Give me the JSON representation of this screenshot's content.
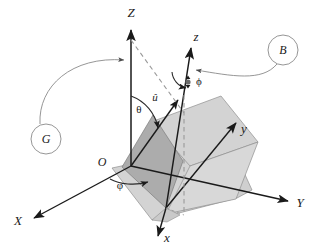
{
  "figure": {
    "background_color": "#ffffff",
    "width": 317,
    "height": 250
  },
  "colors": {
    "stroke": "#1a1a1a",
    "thin_stroke": "#5a5a5a",
    "plane_dark": "#acacac",
    "plane_mid": "#c6c6c6",
    "plane_light": "#d3d3d3",
    "dashed": "#9a9a9a",
    "label_text": "#1a1a1a"
  },
  "axes": {
    "fixed_frame": [
      {
        "name": "Z-axis",
        "label": "Z",
        "label_x": 131,
        "label_y": 14
      },
      {
        "name": "X-axis",
        "label": "X",
        "label_x": 18,
        "label_y": 222
      },
      {
        "name": "Y-axis",
        "label": "Y",
        "label_x": 300,
        "label_y": 204
      }
    ],
    "body_frame": [
      {
        "name": "z-axis",
        "label": "z",
        "label_x": 196,
        "label_y": 38
      },
      {
        "name": "x-axis",
        "label": "x",
        "label_x": 167,
        "label_y": 239
      },
      {
        "name": "y-axis",
        "label": "y",
        "label_x": 244,
        "label_y": 130
      }
    ]
  },
  "origin": {
    "label": "O",
    "label_x": 102,
    "label_y": 163
  },
  "vectors": [
    {
      "name": "u-hat-unit-vector",
      "label": "û",
      "label_x": 155,
      "label_y": 98
    }
  ],
  "angles": [
    {
      "name": "theta-angle",
      "label": "θ",
      "label_x": 139,
      "label_y": 110
    },
    {
      "name": "phi-azimuth-angle",
      "label": "φ",
      "label_x": 120,
      "label_y": 186
    },
    {
      "name": "phi-spin-angle",
      "label": "ϕ",
      "label_x": 196,
      "label_y": 82
    }
  ],
  "group_markers": [
    {
      "name": "group-label-G",
      "label": "G",
      "cx": 46,
      "cy": 139,
      "r": 15
    },
    {
      "name": "group-label-B",
      "label": "B",
      "cx": 283,
      "cy": 50,
      "r": 15
    }
  ],
  "planes": [
    {
      "name": "ground-plane",
      "fill": "#d3d3d3"
    },
    {
      "name": "body-xy-plane",
      "fill": "#d3d3d3"
    },
    {
      "name": "meridian-plane",
      "fill": "#acacac"
    }
  ]
}
